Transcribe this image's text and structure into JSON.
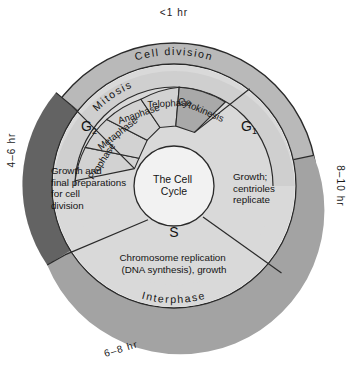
{
  "figure": {
    "title": "The Cell Cycle",
    "hub_label_line1": "The Cell",
    "hub_label_line2": "Cycle"
  },
  "timing": {
    "top": "<1 hr",
    "right": "8–10 hr",
    "bottom": "6–8 hr",
    "left": "4–6 hr"
  },
  "outer_ring": {
    "cell_division": "Cell division",
    "interphase": "Interphase"
  },
  "mitosis_ring": {
    "label": "Mitosis"
  },
  "mitosis_phases": [
    {
      "label": "Prophase",
      "shade": "light"
    },
    {
      "label": "Metaphase",
      "shade": "light"
    },
    {
      "label": "Anaphase",
      "shade": "light"
    },
    {
      "label": "Telophase",
      "shade": "light"
    },
    {
      "label": "Cytokinesis",
      "shade": "medium"
    }
  ],
  "interphase_sectors": [
    {
      "name": "G1",
      "base": "G",
      "sub": "1",
      "description_lines": [
        "Growth;",
        "centrioles",
        "replicate"
      ]
    },
    {
      "name": "S",
      "base": "S",
      "sub": "",
      "description_lines": [
        "Chromosome replication",
        "(DNA synthesis), growth"
      ]
    },
    {
      "name": "G2",
      "base": "G",
      "sub": "2",
      "description_lines": [
        "Growth and",
        "final preparations",
        "for cell",
        "division"
      ]
    }
  ],
  "colors": {
    "background": "#ffffff",
    "outer_ring_light": "#b9b9b9",
    "outer_ring_mid": "#a8a8a8",
    "outer_ring_dark": "#6a6a6a",
    "inner_disc": "#d9d9d9",
    "phase_wedge": "#d2d2d2",
    "cytokinesis_wedge": "#a9a9a9",
    "hub_fill": "#f2f2f2",
    "stroke": "#2a2a2a",
    "text": "#141414"
  }
}
